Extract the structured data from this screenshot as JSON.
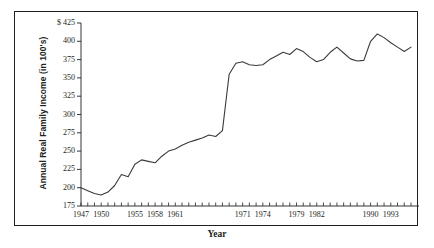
{
  "chart_data": {
    "type": "line",
    "title": "",
    "xlabel": "Year",
    "ylabel": "Annual Real Family Income (in 100's)",
    "y_axis_prefix": "$",
    "ylim": [
      175,
      425
    ],
    "ytick_step": 25,
    "yticks": [
      175,
      200,
      225,
      250,
      275,
      300,
      325,
      350,
      375,
      400,
      425
    ],
    "ytick_labels": [
      "175",
      "200",
      "225",
      "250",
      "275",
      "300",
      "325",
      "350",
      "375",
      "400",
      "$ 425"
    ],
    "grid": false,
    "legend": "none",
    "xlim": [
      1947,
      1996
    ],
    "xtick_labels": [
      "1947",
      "1950",
      "1955",
      "1958",
      "1961",
      "1971",
      "1974",
      "1979",
      "1982",
      "1990",
      "1993"
    ],
    "xtick_values": [
      1947,
      1950,
      1955,
      1958,
      1961,
      1971,
      1974,
      1979,
      1982,
      1990,
      1993
    ],
    "x": [
      1947,
      1948,
      1949,
      1950,
      1951,
      1952,
      1953,
      1954,
      1955,
      1956,
      1957,
      1958,
      1959,
      1960,
      1961,
      1962,
      1963,
      1964,
      1965,
      1966,
      1967,
      1968,
      1969,
      1970,
      1971,
      1972,
      1973,
      1974,
      1975,
      1976,
      1977,
      1978,
      1979,
      1980,
      1981,
      1982,
      1983,
      1984,
      1985,
      1986,
      1987,
      1988,
      1989,
      1990,
      1991,
      1992,
      1993,
      1994,
      1995,
      1996
    ],
    "values": [
      200,
      196,
      192,
      190,
      194,
      203,
      218,
      215,
      232,
      238,
      236,
      234,
      243,
      250,
      253,
      258,
      262,
      265,
      268,
      272,
      270,
      278,
      355,
      370,
      372,
      368,
      367,
      368,
      375,
      380,
      385,
      382,
      390,
      386,
      378,
      372,
      375,
      385,
      392,
      384,
      376,
      373,
      374,
      400,
      410,
      405,
      398,
      392,
      386,
      392
    ],
    "series_name": "Annual Real Family Income",
    "line_color": "#3a3a3a"
  }
}
